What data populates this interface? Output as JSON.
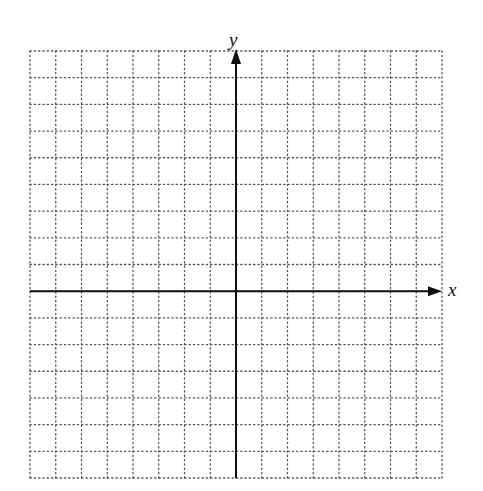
{
  "diagram": {
    "type": "coordinate-grid",
    "x_axis_label": "x",
    "y_axis_label": "y",
    "grid": {
      "columns_left_of_y_axis": 8,
      "columns_right_of_y_axis": 8,
      "rows_above_x_axis": 9,
      "rows_below_x_axis": 7,
      "line_style": "dotted"
    },
    "colors": {
      "axis": "#111111",
      "grid": "#555555",
      "background": "#ffffff"
    }
  }
}
